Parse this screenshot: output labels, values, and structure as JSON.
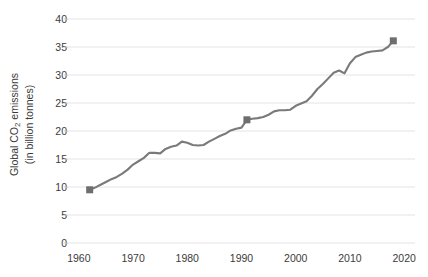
{
  "chart_data": {
    "type": "line",
    "title": "",
    "xlabel": "",
    "ylabel_line1": "Global CO",
    "ylabel_sub": "2",
    "ylabel_line1_tail": " emissions",
    "ylabel_line2": "(in billion tonnes)",
    "ylabel_full": "Global CO2 emissions (in billion tonnes)",
    "xlim": [
      1958,
      2022
    ],
    "ylim": [
      0,
      40
    ],
    "grid": true,
    "legend": "none",
    "yticks": [
      0,
      5,
      10,
      15,
      20,
      25,
      30,
      35,
      40
    ],
    "ytick_labels": [
      "0",
      "5",
      "10",
      "15",
      "20",
      "25",
      "30",
      "35",
      "40"
    ],
    "xticks": [
      1960,
      1970,
      1980,
      1990,
      2000,
      2010,
      2020
    ],
    "xtick_labels": [
      "1960",
      "1970",
      "1980",
      "1990",
      "2000",
      "2010",
      "2020"
    ],
    "line_color": "#7a7a7a",
    "marker_color": "#6e6e6e",
    "grid_color": "#e4e4e4",
    "text_color": "#3b3b3b",
    "markers": [
      {
        "x": 1962,
        "y": 9.5
      },
      {
        "x": 1991,
        "y": 22.0
      },
      {
        "x": 2018,
        "y": 36.1
      }
    ],
    "x": [
      1962,
      1963,
      1964,
      1965,
      1966,
      1967,
      1968,
      1969,
      1970,
      1971,
      1972,
      1973,
      1974,
      1975,
      1976,
      1977,
      1978,
      1979,
      1980,
      1981,
      1982,
      1983,
      1984,
      1985,
      1986,
      1987,
      1988,
      1989,
      1990,
      1991,
      1992,
      1993,
      1994,
      1995,
      1996,
      1997,
      1998,
      1999,
      2000,
      2001,
      2002,
      2003,
      2004,
      2005,
      2006,
      2007,
      2008,
      2009,
      2010,
      2011,
      2012,
      2013,
      2014,
      2015,
      2016,
      2017,
      2018
    ],
    "values": [
      9.5,
      9.9,
      10.4,
      10.9,
      11.4,
      11.8,
      12.4,
      13.1,
      14.0,
      14.6,
      15.2,
      16.1,
      16.1,
      16.0,
      16.8,
      17.2,
      17.4,
      18.1,
      17.9,
      17.5,
      17.4,
      17.5,
      18.1,
      18.6,
      19.1,
      19.5,
      20.1,
      20.4,
      20.6,
      22.0,
      22.2,
      22.3,
      22.5,
      22.9,
      23.5,
      23.7,
      23.7,
      23.8,
      24.5,
      24.9,
      25.3,
      26.3,
      27.5,
      28.4,
      29.4,
      30.4,
      30.8,
      30.3,
      32.1,
      33.2,
      33.6,
      34.0,
      34.2,
      34.3,
      34.4,
      35.0,
      36.1
    ]
  }
}
